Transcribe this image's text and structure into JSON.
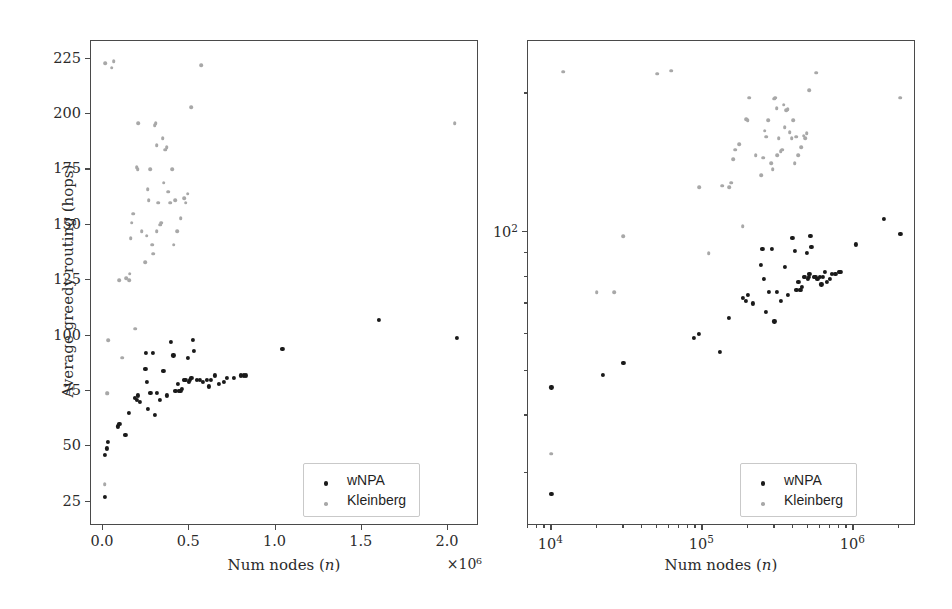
{
  "figure": {
    "panels": [
      "linear",
      "log"
    ]
  },
  "legend": {
    "entries": [
      {
        "label": "wNPA",
        "color": "#1a1a1a",
        "marker": "dot"
      },
      {
        "label": "Kleinberg",
        "color": "#a8a8a8",
        "marker": "dot"
      }
    ]
  },
  "chart_data": [
    {
      "type": "scatter",
      "panel": "left",
      "title": "",
      "xlabel": "Num nodes (n)",
      "ylabel": "Average greedy routing (hops)",
      "xscale": "linear",
      "yscale": "linear",
      "xlim": [
        -70000,
        2180000
      ],
      "ylim": [
        14,
        233
      ],
      "x_offset_text": "×10⁶",
      "xticks": [
        0.0,
        0.5,
        1.0,
        1.5,
        2.0
      ],
      "xticklabels": [
        "0.0",
        "0.5",
        "1.0",
        "1.5",
        "2.0"
      ],
      "xtick_values": [
        0,
        500000,
        1000000,
        1500000,
        2000000
      ],
      "yticks": [
        25,
        50,
        75,
        100,
        125,
        150,
        175,
        200,
        225
      ],
      "yticklabels": [
        "25",
        "50",
        "75",
        "100",
        "125",
        "150",
        "175",
        "200",
        "225"
      ],
      "grid": false,
      "legend_position": "lower right",
      "series": [
        {
          "name": "wNPA",
          "color": "#1a1a1a",
          "points": [
            [
              10000,
              27
            ],
            [
              10000,
              46
            ],
            [
              22000,
              49
            ],
            [
              30000,
              52
            ],
            [
              88000,
              59
            ],
            [
              95000,
              60
            ],
            [
              130000,
              55
            ],
            [
              150000,
              65
            ],
            [
              185000,
              72
            ],
            [
              195000,
              71
            ],
            [
              200000,
              73
            ],
            [
              215000,
              70
            ],
            [
              245000,
              85
            ],
            [
              250000,
              92
            ],
            [
              255000,
              79
            ],
            [
              262000,
              67
            ],
            [
              275000,
              74
            ],
            [
              288000,
              92
            ],
            [
              300000,
              64
            ],
            [
              310000,
              74
            ],
            [
              330000,
              71
            ],
            [
              350000,
              84
            ],
            [
              370000,
              73
            ],
            [
              395000,
              97
            ],
            [
              408000,
              91
            ],
            [
              420000,
              75
            ],
            [
              432000,
              78
            ],
            [
              440000,
              75
            ],
            [
              448000,
              75
            ],
            [
              455000,
              76
            ],
            [
              470000,
              80
            ],
            [
              478000,
              80
            ],
            [
              490000,
              90
            ],
            [
              498000,
              79
            ],
            [
              505000,
              80
            ],
            [
              512000,
              81
            ],
            [
              520000,
              98
            ],
            [
              528000,
              93
            ],
            [
              545000,
              80
            ],
            [
              560000,
              80
            ],
            [
              578000,
              79
            ],
            [
              600000,
              80
            ],
            [
              615000,
              77
            ],
            [
              625000,
              80
            ],
            [
              648000,
              82
            ],
            [
              672000,
              78
            ],
            [
              700000,
              79
            ],
            [
              718000,
              81
            ],
            [
              760000,
              81
            ],
            [
              800000,
              82
            ],
            [
              815000,
              82
            ],
            [
              830000,
              82
            ],
            [
              1040000,
              94
            ],
            [
              1600000,
              107
            ],
            [
              2050000,
              99
            ]
          ]
        },
        {
          "name": "Kleinberg",
          "color": "#a8a8a8",
          "points": [
            [
              10000,
              33
            ],
            [
              20000,
              74
            ],
            [
              26000,
              74
            ],
            [
              30000,
              98
            ],
            [
              95000,
              125
            ],
            [
              110000,
              90
            ],
            [
              135000,
              126
            ],
            [
              155000,
              128
            ],
            [
              160000,
              144
            ],
            [
              165000,
              151
            ],
            [
              175000,
              155
            ],
            [
              185000,
              103
            ],
            [
              195000,
              176
            ],
            [
              200000,
              175
            ],
            [
              205000,
              196
            ],
            [
              225000,
              147
            ],
            [
              245000,
              133
            ],
            [
              252000,
              145
            ],
            [
              258000,
              166
            ],
            [
              265000,
              161
            ],
            [
              272000,
              175
            ],
            [
              285000,
              141
            ],
            [
              292000,
              137
            ],
            [
              300000,
              195
            ],
            [
              305000,
              196
            ],
            [
              312000,
              147
            ],
            [
              320000,
              160
            ],
            [
              330000,
              150
            ],
            [
              338000,
              151
            ],
            [
              345000,
              189
            ],
            [
              352000,
              169
            ],
            [
              360000,
              184
            ],
            [
              368000,
              185
            ],
            [
              378000,
              165
            ],
            [
              390000,
              160
            ],
            [
              400000,
              175
            ],
            [
              410000,
              141
            ],
            [
              420000,
              161
            ],
            [
              430000,
              147
            ],
            [
              450000,
              153
            ],
            [
              470000,
              162
            ],
            [
              480000,
              160
            ],
            [
              510000,
              203
            ],
            [
              570000,
              222
            ],
            [
              2040000,
              196
            ],
            [
              12000,
              223
            ],
            [
              50000,
              221
            ],
            [
              62000,
              224
            ],
            [
              490000,
              164
            ],
            [
              310000,
              186
            ],
            [
              150000,
              125
            ]
          ]
        }
      ]
    },
    {
      "type": "scatter",
      "panel": "right",
      "title": "",
      "xlabel": "Num nodes (n)",
      "ylabel": "",
      "xscale": "log",
      "yscale": "log",
      "xlim": [
        7000,
        2600000
      ],
      "ylim": [
        23,
        260
      ],
      "xticks": [
        10000,
        100000,
        1000000
      ],
      "xticklabels": [
        "10⁴",
        "10⁵",
        "10⁶"
      ],
      "yticks": [
        100
      ],
      "yticklabels": [
        "10²"
      ],
      "y_minor_ticks": [
        30,
        40,
        50,
        60,
        70,
        80,
        90,
        200
      ],
      "grid": false,
      "legend_position": "lower right",
      "series": [
        {
          "name": "wNPA",
          "color": "#1a1a1a",
          "points": [
            [
              10000,
              27
            ],
            [
              10000,
              46
            ],
            [
              22000,
              49
            ],
            [
              30000,
              52
            ],
            [
              88000,
              59
            ],
            [
              95000,
              60
            ],
            [
              130000,
              55
            ],
            [
              150000,
              65
            ],
            [
              185000,
              72
            ],
            [
              195000,
              71
            ],
            [
              200000,
              73
            ],
            [
              215000,
              70
            ],
            [
              245000,
              85
            ],
            [
              250000,
              92
            ],
            [
              255000,
              79
            ],
            [
              262000,
              67
            ],
            [
              275000,
              74
            ],
            [
              288000,
              92
            ],
            [
              300000,
              64
            ],
            [
              310000,
              74
            ],
            [
              330000,
              71
            ],
            [
              350000,
              84
            ],
            [
              370000,
              73
            ],
            [
              395000,
              97
            ],
            [
              408000,
              91
            ],
            [
              420000,
              75
            ],
            [
              432000,
              78
            ],
            [
              440000,
              75
            ],
            [
              448000,
              75
            ],
            [
              455000,
              76
            ],
            [
              470000,
              80
            ],
            [
              478000,
              80
            ],
            [
              490000,
              90
            ],
            [
              498000,
              79
            ],
            [
              505000,
              80
            ],
            [
              512000,
              81
            ],
            [
              520000,
              98
            ],
            [
              528000,
              93
            ],
            [
              545000,
              80
            ],
            [
              560000,
              80
            ],
            [
              578000,
              79
            ],
            [
              600000,
              80
            ],
            [
              615000,
              77
            ],
            [
              625000,
              80
            ],
            [
              648000,
              82
            ],
            [
              672000,
              78
            ],
            [
              700000,
              79
            ],
            [
              718000,
              81
            ],
            [
              760000,
              81
            ],
            [
              800000,
              82
            ],
            [
              815000,
              82
            ],
            [
              830000,
              82
            ],
            [
              1040000,
              94
            ],
            [
              1600000,
              107
            ],
            [
              2050000,
              99
            ]
          ]
        },
        {
          "name": "Kleinberg",
          "color": "#a8a8a8",
          "points": [
            [
              10000,
              33
            ],
            [
              20000,
              74
            ],
            [
              26000,
              74
            ],
            [
              30000,
              98
            ],
            [
              95000,
              125
            ],
            [
              110000,
              90
            ],
            [
              135000,
              126
            ],
            [
              155000,
              128
            ],
            [
              160000,
              144
            ],
            [
              165000,
              151
            ],
            [
              175000,
              155
            ],
            [
              185000,
              103
            ],
            [
              195000,
              176
            ],
            [
              200000,
              175
            ],
            [
              205000,
              196
            ],
            [
              225000,
              147
            ],
            [
              245000,
              133
            ],
            [
              252000,
              145
            ],
            [
              258000,
              166
            ],
            [
              265000,
              161
            ],
            [
              272000,
              175
            ],
            [
              285000,
              141
            ],
            [
              292000,
              137
            ],
            [
              300000,
              195
            ],
            [
              305000,
              196
            ],
            [
              312000,
              147
            ],
            [
              320000,
              160
            ],
            [
              330000,
              150
            ],
            [
              338000,
              151
            ],
            [
              345000,
              189
            ],
            [
              352000,
              169
            ],
            [
              360000,
              184
            ],
            [
              368000,
              185
            ],
            [
              378000,
              165
            ],
            [
              390000,
              160
            ],
            [
              400000,
              175
            ],
            [
              410000,
              141
            ],
            [
              420000,
              161
            ],
            [
              430000,
              147
            ],
            [
              450000,
              153
            ],
            [
              470000,
              162
            ],
            [
              480000,
              160
            ],
            [
              510000,
              203
            ],
            [
              570000,
              222
            ],
            [
              2040000,
              196
            ],
            [
              12000,
              223
            ],
            [
              50000,
              221
            ],
            [
              62000,
              224
            ],
            [
              490000,
              164
            ],
            [
              310000,
              186
            ],
            [
              150000,
              125
            ]
          ]
        }
      ]
    }
  ]
}
